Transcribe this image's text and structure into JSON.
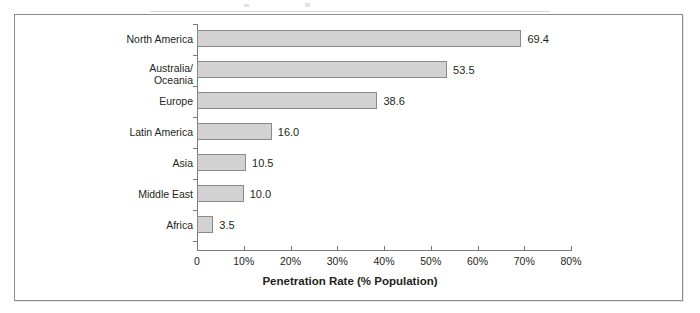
{
  "chart_data": {
    "type": "bar",
    "orientation": "horizontal",
    "title": "",
    "subtitle": "",
    "xlabel": "Penetration Rate (% Population)",
    "ylabel": "",
    "categories": [
      "North America",
      "Australia/\nOceania",
      "Europe",
      "Latin America",
      "Asia",
      "Middle East",
      "Africa"
    ],
    "values": [
      69.4,
      53.5,
      38.6,
      16.0,
      10.5,
      10.0,
      3.5
    ],
    "value_labels": [
      "69.4",
      "53.5",
      "38.6",
      "16.0",
      "10.5",
      "10.0",
      "3.5"
    ],
    "xlim": [
      0,
      80
    ],
    "xticks": [
      0,
      10,
      20,
      30,
      40,
      50,
      60,
      70,
      80
    ],
    "xtick_labels": [
      "0",
      "10%",
      "20%",
      "30%",
      "40%",
      "50%",
      "60%",
      "70%",
      "80%"
    ],
    "grid": false,
    "legend": null,
    "bar_fill_color": "#d2d2d2",
    "bar_border_color": "#8a8a8a",
    "axis_color": "#7a7a7a",
    "text_color": "#231f20",
    "frame_border_color": "#8d8d8d"
  }
}
